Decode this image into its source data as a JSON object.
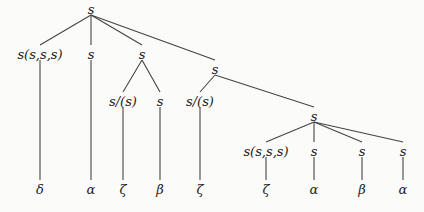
{
  "tree": {
    "nodes": [
      {
        "id": "root",
        "label": "s",
        "parent": null
      },
      {
        "id": "n1",
        "label": "s(s,s,s)",
        "parent": "root"
      },
      {
        "id": "n2",
        "label": "s",
        "parent": "root"
      },
      {
        "id": "n3",
        "label": "s",
        "parent": "root"
      },
      {
        "id": "n4",
        "label": "s",
        "parent": "root"
      },
      {
        "id": "n3a",
        "label": "s/(s)",
        "parent": "n3"
      },
      {
        "id": "n3b",
        "label": "s",
        "parent": "n3"
      },
      {
        "id": "n4a",
        "label": "s/(s)",
        "parent": "n4"
      },
      {
        "id": "n4b",
        "label": "s",
        "parent": "n4"
      },
      {
        "id": "n4b1",
        "label": "s(s,s,s)",
        "parent": "n4b"
      },
      {
        "id": "n4b2",
        "label": "s",
        "parent": "n4b"
      },
      {
        "id": "n4b3",
        "label": "s",
        "parent": "n4b"
      },
      {
        "id": "n4b4",
        "label": "s",
        "parent": "n4b"
      },
      {
        "id": "l1",
        "label": "δ",
        "parent": "n1"
      },
      {
        "id": "l2",
        "label": "α",
        "parent": "n2"
      },
      {
        "id": "l3",
        "label": "ζ",
        "parent": "n3a"
      },
      {
        "id": "l4",
        "label": "β",
        "parent": "n3b"
      },
      {
        "id": "l5",
        "label": "ζ",
        "parent": "n4a"
      },
      {
        "id": "l6",
        "label": "ζ",
        "parent": "n4b1"
      },
      {
        "id": "l7",
        "label": "α",
        "parent": "n4b2"
      },
      {
        "id": "l8",
        "label": "β",
        "parent": "n4b3"
      },
      {
        "id": "l9",
        "label": "α",
        "parent": "n4b4"
      }
    ]
  }
}
